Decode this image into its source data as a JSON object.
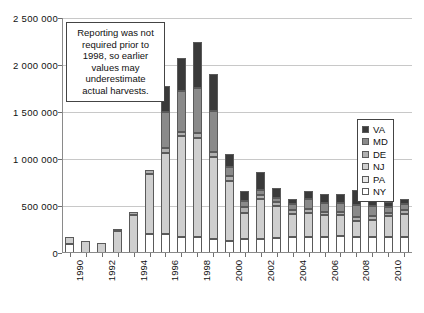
{
  "chart_data": {
    "type": "bar",
    "subtype": "stacked-column",
    "title": "",
    "xlabel": "",
    "ylabel": "",
    "ylim": [
      0,
      2500000
    ],
    "ytick_step": 500000,
    "ytick_labels": [
      "2 500 000",
      "2 000 000",
      "1 500 000",
      "1 000 000",
      "500 000",
      "0"
    ],
    "ytick_values": [
      2500000,
      2000000,
      1500000,
      1000000,
      500000,
      0
    ],
    "grid": true,
    "legend_position": "inside-upper-right",
    "categories": [
      "1990",
      "1991",
      "1992",
      "1993",
      "1994",
      "1995",
      "1996",
      "1997",
      "1998",
      "1999",
      "2000",
      "2001",
      "2002",
      "2003",
      "2004",
      "2005",
      "2006",
      "2007",
      "2008",
      "2009",
      "2010",
      "2011"
    ],
    "xtick_labels_shown": [
      "1990",
      "1992",
      "1994",
      "1996",
      "1998",
      "2000",
      "2002",
      "2004",
      "2006",
      "2008",
      "2010"
    ],
    "xtick_label_rotation": -90,
    "series": [
      {
        "name": "NY",
        "color": "#ffffff",
        "values": [
          100000,
          0,
          0,
          0,
          0,
          200000,
          200000,
          170000,
          170000,
          150000,
          130000,
          150000,
          150000,
          160000,
          170000,
          170000,
          170000,
          180000,
          170000,
          170000,
          170000,
          170000
        ]
      },
      {
        "name": "PA",
        "color": "#e8e8e8",
        "values": [
          0,
          0,
          0,
          0,
          0,
          0,
          0,
          0,
          0,
          0,
          0,
          0,
          0,
          0,
          0,
          0,
          0,
          0,
          0,
          0,
          0,
          0
        ]
      },
      {
        "name": "NJ",
        "color": "#cfcfcf",
        "values": [
          70000,
          130000,
          110000,
          230000,
          400000,
          640000,
          860000,
          1070000,
          1050000,
          870000,
          640000,
          280000,
          420000,
          340000,
          250000,
          260000,
          230000,
          220000,
          170000,
          180000,
          220000,
          250000
        ]
      },
      {
        "name": "DE",
        "color": "#b0b0b0",
        "values": [
          0,
          0,
          0,
          30000,
          40000,
          40000,
          60000,
          50000,
          60000,
          50000,
          50000,
          60000,
          50000,
          40000,
          40000,
          40000,
          40000,
          40000,
          40000,
          40000,
          40000,
          40000
        ]
      },
      {
        "name": "MD",
        "color": "#8a8a8a",
        "values": [
          0,
          0,
          0,
          0,
          0,
          0,
          380000,
          430000,
          480000,
          440000,
          100000,
          60000,
          50000,
          50000,
          60000,
          100000,
          90000,
          90000,
          130000,
          110000,
          60000,
          60000
        ]
      },
      {
        "name": "VA",
        "color": "#3a3a3a",
        "values": [
          0,
          0,
          0,
          0,
          0,
          0,
          280000,
          360000,
          490000,
          390000,
          130000,
          110000,
          190000,
          100000,
          60000,
          90000,
          100000,
          100000,
          160000,
          130000,
          50000,
          50000
        ]
      }
    ],
    "totals": [
      170000,
      130000,
      110000,
      260000,
      440000,
      880000,
      1780000,
      2080000,
      2250000,
      1900000,
      1050000,
      660000,
      860000,
      690000,
      580000,
      660000,
      630000,
      630000,
      670000,
      630000,
      540000,
      570000
    ],
    "series_stack_order_bottom_to_top": [
      "NY",
      "PA",
      "NJ",
      "DE",
      "MD",
      "VA"
    ],
    "annotation": "Reporting was not required prior to 1998, so earlier values may underestimate actual harvests."
  },
  "legend": {
    "entries": [
      {
        "label": "VA",
        "color": "#3a3a3a"
      },
      {
        "label": "MD",
        "color": "#8a8a8a"
      },
      {
        "label": "DE",
        "color": "#b0b0b0"
      },
      {
        "label": "NJ",
        "color": "#cfcfcf"
      },
      {
        "label": "PA",
        "color": "#e8e8e8"
      },
      {
        "label": "NY",
        "color": "#ffffff"
      }
    ]
  }
}
